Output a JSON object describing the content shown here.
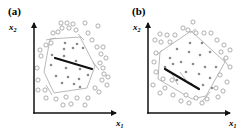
{
  "panels": [
    {
      "label": "(a)",
      "x_axis_label": "x",
      "x_axis_sub": "1",
      "y_axis_label": "x",
      "y_axis_sub": "2",
      "origin": [
        34,
        113
      ],
      "x_axis_end": [
        119,
        113
      ],
      "y_axis_end": [
        34,
        20
      ],
      "label_pos": [
        8,
        15
      ],
      "ylabel_pos": [
        9,
        30
      ],
      "xlabel_pos": [
        116,
        126
      ],
      "polygon": [
        [
          50,
          39
        ],
        [
          80,
          37
        ],
        [
          95,
          66
        ],
        [
          87,
          88
        ],
        [
          54,
          93
        ],
        [
          44,
          72
        ]
      ],
      "polygon_extensions": [
        [
          [
            46,
            40
          ],
          [
            56,
            38
          ]
        ],
        [
          [
            78,
            34
          ],
          [
            84,
            40
          ]
        ],
        [
          [
            93,
            62
          ],
          [
            99,
            70
          ]
        ],
        [
          [
            52,
            95
          ],
          [
            46,
            85
          ]
        ]
      ],
      "thick_line": [
        [
          55,
          58
        ],
        [
          92,
          69
        ]
      ],
      "filled_points": [
        [
          65,
          43
        ],
        [
          77,
          44
        ],
        [
          64,
          49
        ],
        [
          73,
          48
        ],
        [
          83,
          48
        ],
        [
          51,
          65
        ],
        [
          66,
          68
        ],
        [
          80,
          69
        ],
        [
          88,
          75
        ],
        [
          56,
          76
        ],
        [
          68,
          77
        ],
        [
          79,
          79
        ],
        [
          62,
          83
        ],
        [
          74,
          84
        ],
        [
          80,
          87
        ],
        [
          52,
          55
        ],
        [
          64,
          56
        ],
        [
          76,
          61
        ]
      ],
      "open_points": [
        [
          61,
          23
        ],
        [
          67,
          23
        ],
        [
          73,
          24
        ],
        [
          85,
          23
        ],
        [
          62,
          28
        ],
        [
          69,
          28
        ],
        [
          76,
          30
        ],
        [
          53,
          33
        ],
        [
          58,
          32
        ],
        [
          88,
          33
        ],
        [
          98,
          26
        ],
        [
          97,
          47
        ],
        [
          103,
          47
        ],
        [
          46,
          45
        ],
        [
          40,
          50
        ],
        [
          41,
          56
        ],
        [
          101,
          54
        ],
        [
          106,
          58
        ],
        [
          100,
          63
        ],
        [
          103,
          68
        ],
        [
          37,
          68
        ],
        [
          104,
          74
        ],
        [
          108,
          77
        ],
        [
          102,
          80
        ],
        [
          38,
          80
        ],
        [
          107,
          85
        ],
        [
          38,
          90
        ],
        [
          45,
          90
        ],
        [
          95,
          88
        ],
        [
          99,
          92
        ],
        [
          46,
          98
        ],
        [
          56,
          99
        ],
        [
          66,
          97
        ],
        [
          77,
          98
        ],
        [
          88,
          98
        ],
        [
          63,
          105
        ],
        [
          71,
          104
        ],
        [
          85,
          105
        ],
        [
          51,
          43
        ],
        [
          92,
          40
        ]
      ],
      "thick_color": "#111111",
      "open_color": "#9a9a9a",
      "filled_color": "#8a8a8a",
      "poly_color": "#b0b0b0"
    },
    {
      "label": "(b)",
      "x_axis_label": "x",
      "x_axis_sub": "1",
      "y_axis_label": "x",
      "y_axis_sub": "2",
      "origin": [
        148,
        113
      ],
      "x_axis_end": [
        233,
        113
      ],
      "y_axis_end": [
        148,
        20
      ],
      "label_pos": [
        132,
        15
      ],
      "ylabel_pos": [
        133,
        30
      ],
      "xlabel_pos": [
        229,
        126
      ],
      "polygon": [
        [
          160,
          52
        ],
        [
          191,
          31
        ],
        [
          225,
          62
        ],
        [
          206,
          96
        ],
        [
          192,
          99
        ],
        [
          158,
          79
        ]
      ],
      "polygon_extensions": [
        [
          [
            157,
            55
          ],
          [
            162,
            50
          ]
        ],
        [
          [
            196,
            29
          ],
          [
            190,
            33
          ]
        ],
        [
          [
            223,
            58
          ],
          [
            229,
            67
          ]
        ],
        [
          [
            210,
            92
          ],
          [
            200,
            104
          ]
        ],
        [
          [
            172,
            74
          ],
          [
            178,
            85
          ]
        ],
        [
          [
            180,
            72
          ],
          [
            186,
            80
          ]
        ]
      ],
      "thick_line": [
        [
          165,
          69
        ],
        [
          199,
          89
        ]
      ],
      "filled_points": [
        [
          190,
          43
        ],
        [
          202,
          43
        ],
        [
          177,
          49
        ],
        [
          189,
          52
        ],
        [
          200,
          55
        ],
        [
          210,
          52
        ],
        [
          170,
          58
        ],
        [
          181,
          62
        ],
        [
          193,
          64
        ],
        [
          205,
          67
        ],
        [
          216,
          67
        ],
        [
          173,
          64
        ],
        [
          186,
          72
        ],
        [
          199,
          74
        ],
        [
          210,
          78
        ],
        [
          165,
          67
        ],
        [
          177,
          80
        ],
        [
          191,
          84
        ],
        [
          203,
          85
        ],
        [
          212,
          88
        ]
      ],
      "open_points": [
        [
          193,
          22
        ],
        [
          183,
          28
        ],
        [
          188,
          30
        ],
        [
          196,
          33
        ],
        [
          204,
          33
        ],
        [
          211,
          33
        ],
        [
          160,
          34
        ],
        [
          167,
          35
        ],
        [
          175,
          35
        ],
        [
          155,
          40
        ],
        [
          161,
          42
        ],
        [
          170,
          42
        ],
        [
          217,
          40
        ],
        [
          224,
          45
        ],
        [
          230,
          50
        ],
        [
          221,
          52
        ],
        [
          156,
          53
        ],
        [
          154,
          62
        ],
        [
          226,
          58
        ],
        [
          230,
          67
        ],
        [
          156,
          72
        ],
        [
          220,
          75
        ],
        [
          227,
          82
        ],
        [
          163,
          79
        ],
        [
          172,
          80
        ],
        [
          153,
          85
        ],
        [
          165,
          88
        ],
        [
          216,
          88
        ],
        [
          223,
          91
        ],
        [
          160,
          93
        ],
        [
          173,
          95
        ],
        [
          186,
          95
        ],
        [
          196,
          98
        ],
        [
          207,
          99
        ],
        [
          218,
          97
        ],
        [
          181,
          101
        ],
        [
          189,
          103
        ],
        [
          202,
          103
        ]
      ],
      "thick_color": "#111111",
      "open_color": "#9a9a9a",
      "filled_color": "#8a8a8a",
      "poly_color": "#b0b0b0"
    }
  ]
}
